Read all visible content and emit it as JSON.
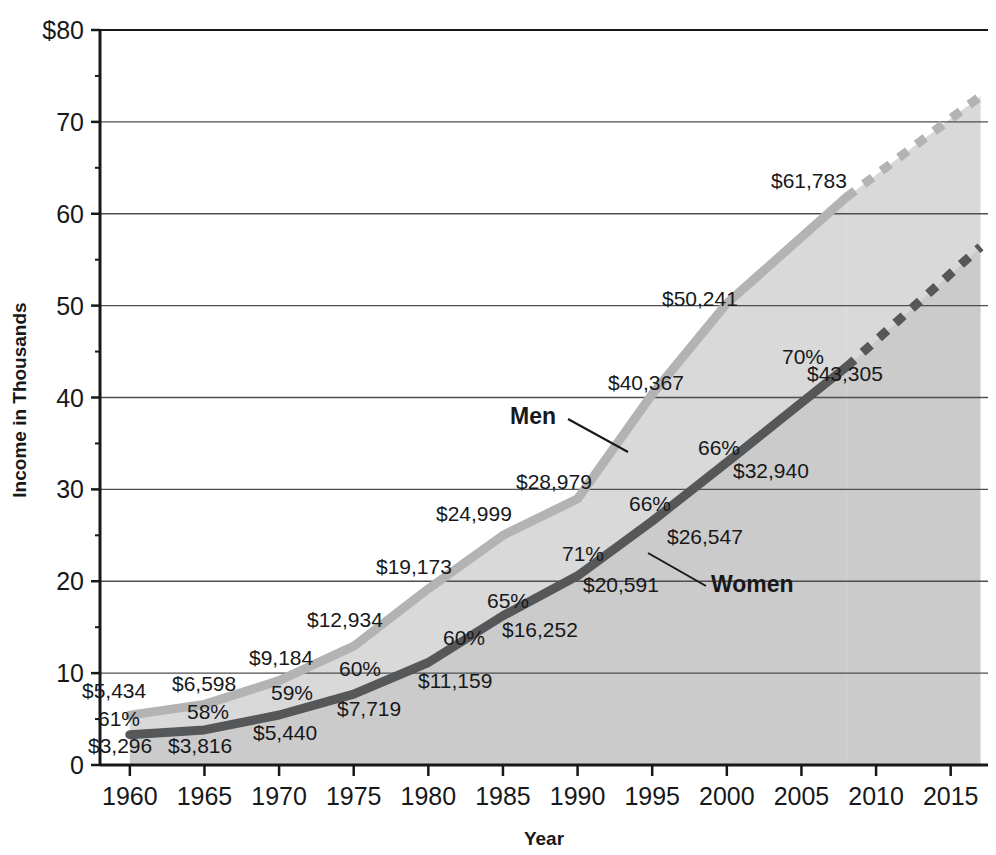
{
  "chart_data": {
    "type": "area",
    "title": "",
    "xlabel": "Year",
    "ylabel": "Income in Thousands",
    "xlim": [
      1958,
      2017.5
    ],
    "ylim": [
      0,
      80
    ],
    "grid": true,
    "legend_position": "inline-annotations",
    "x_ticks": [
      "1960",
      "1965",
      "1970",
      "1975",
      "1980",
      "1985",
      "1990",
      "1995",
      "2000",
      "2005",
      "2010",
      "2015"
    ],
    "y_ticks": [
      "$80",
      "70",
      "60",
      "50",
      "40",
      "30",
      "20",
      "10",
      "0"
    ],
    "x": [
      1960,
      1965,
      1970,
      1975,
      1980,
      1985,
      1990,
      1995,
      2000,
      2008
    ],
    "series": [
      {
        "name": "Men",
        "color": "#b3b3b3",
        "values": [
          5434,
          6598,
          9184,
          12934,
          19173,
          24999,
          28979,
          40367,
          50241,
          61783
        ],
        "labels": [
          "$5,434",
          "$6,598",
          "$9,184",
          "$12,934",
          "$19,173",
          "$24,999",
          "$28,979",
          "$40,367",
          "$50,241",
          "$61,783"
        ],
        "projection": {
          "from_year": 2008,
          "from_value": 61783,
          "to_year": 2017,
          "to_value": 72800,
          "style": "dashed"
        }
      },
      {
        "name": "Women",
        "color": "#555759",
        "values": [
          3296,
          3816,
          5440,
          7719,
          11159,
          16252,
          20591,
          26547,
          32940,
          43305
        ],
        "labels": [
          "$3,296",
          "$3,816",
          "$5,440",
          "$7,719",
          "$11,159",
          "$16,252",
          "$20,591",
          "$26,547",
          "$32,940",
          "$43,305"
        ],
        "ratio_labels": [
          "61%",
          "58%",
          "59%",
          "60%",
          "60%",
          "65%",
          "71%",
          "66%",
          "66%",
          "70%"
        ],
        "projection": {
          "from_year": 2008,
          "from_value": 43305,
          "to_year": 2017,
          "to_value": 56400,
          "style": "dashed"
        }
      }
    ],
    "fill_upper_color": "#d9d9d9",
    "fill_lower_color": "#cbcbcb",
    "annotations": [
      {
        "name": "men-series-label",
        "text": "Men",
        "x": 510,
        "y": 424
      },
      {
        "name": "women-series-label",
        "text": "Women",
        "x": 711,
        "y": 592
      }
    ],
    "men_value_labels": [
      {
        "text": "$5,434",
        "x": 82,
        "y": 698
      },
      {
        "text": "$6,598",
        "x": 172,
        "y": 691
      },
      {
        "text": "$9,184",
        "x": 249,
        "y": 665
      },
      {
        "text": "$12,934",
        "x": 307,
        "y": 627
      },
      {
        "text": "$19,173",
        "x": 376,
        "y": 574
      },
      {
        "text": "$24,999",
        "x": 436,
        "y": 521
      },
      {
        "text": "$28,979",
        "x": 516,
        "y": 489
      },
      {
        "text": "$40,367",
        "x": 608,
        "y": 390
      },
      {
        "text": "$50,241",
        "x": 662,
        "y": 306
      },
      {
        "text": "$61,783",
        "x": 771,
        "y": 188
      }
    ],
    "women_value_labels": [
      {
        "text": "$3,296",
        "x": 88,
        "y": 753
      },
      {
        "text": "$3,816",
        "x": 168,
        "y": 753
      },
      {
        "text": "$5,440",
        "x": 253,
        "y": 740
      },
      {
        "text": "$7,719",
        "x": 337,
        "y": 716
      },
      {
        "text": "$11,159",
        "x": 418,
        "y": 688
      },
      {
        "text": "$16,252",
        "x": 502,
        "y": 637
      },
      {
        "text": "$20,591",
        "x": 583,
        "y": 592
      },
      {
        "text": "$26,547",
        "x": 667,
        "y": 544
      },
      {
        "text": "$32,940",
        "x": 733,
        "y": 478
      },
      {
        "text": "$43,305",
        "x": 807,
        "y": 381
      }
    ],
    "ratio_value_labels": [
      {
        "text": "61%",
        "x": 98,
        "y": 726
      },
      {
        "text": "58%",
        "x": 187,
        "y": 719
      },
      {
        "text": "59%",
        "x": 271,
        "y": 700
      },
      {
        "text": "60%",
        "x": 339,
        "y": 676
      },
      {
        "text": "60%",
        "x": 443,
        "y": 645
      },
      {
        "text": "65%",
        "x": 487,
        "y": 608
      },
      {
        "text": "71%",
        "x": 562,
        "y": 561
      },
      {
        "text": "66%",
        "x": 629,
        "y": 511
      },
      {
        "text": "66%",
        "x": 698,
        "y": 455
      },
      {
        "text": "70%",
        "x": 782,
        "y": 364
      }
    ]
  },
  "axis": {
    "y_label": "Income in Thousands",
    "x_label": "Year"
  }
}
